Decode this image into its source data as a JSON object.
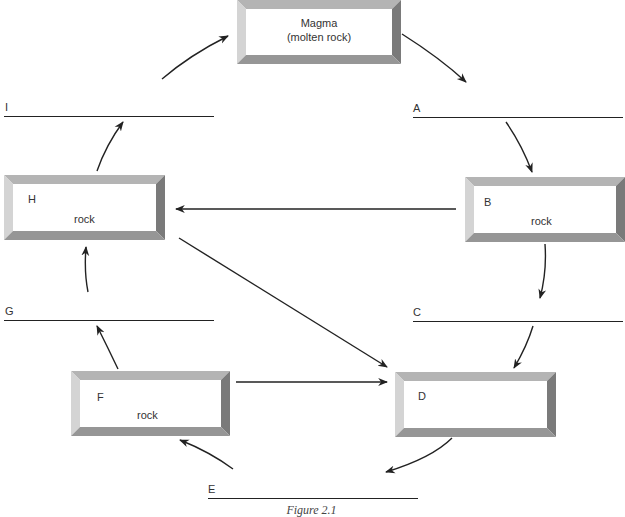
{
  "diagram": {
    "type": "rock-cycle-worksheet",
    "caption": "Figure 2.1",
    "boxes": {
      "magma": {
        "line1": "Magma",
        "line2": "(molten rock)"
      },
      "h": {
        "letter": "H",
        "label": "rock"
      },
      "b": {
        "letter": "B",
        "label": "rock"
      },
      "f": {
        "letter": "F",
        "label": "rock"
      },
      "d": {
        "letter": "D",
        "label": ""
      }
    },
    "blanks": {
      "i": {
        "letter": "I",
        "value": ""
      },
      "a": {
        "letter": "A",
        "value": ""
      },
      "g": {
        "letter": "G",
        "value": ""
      },
      "c": {
        "letter": "C",
        "value": ""
      },
      "e": {
        "letter": "E",
        "value": ""
      }
    },
    "flow": [
      [
        "Magma",
        "A"
      ],
      [
        "A",
        "B"
      ],
      [
        "B",
        "C"
      ],
      [
        "B",
        "H"
      ],
      [
        "C",
        "D"
      ],
      [
        "D",
        "E"
      ],
      [
        "E",
        "F"
      ],
      [
        "F",
        "D"
      ],
      [
        "F",
        "G"
      ],
      [
        "G",
        "H"
      ],
      [
        "H",
        "D"
      ],
      [
        "H",
        "I"
      ],
      [
        "I",
        "Magma"
      ]
    ],
    "colors": {
      "frame_top": "#b4b4b4",
      "frame_left": "#d2d2d2",
      "frame_right": "#7a7a7a",
      "frame_bottom": "#969696",
      "line": "#222222"
    }
  }
}
